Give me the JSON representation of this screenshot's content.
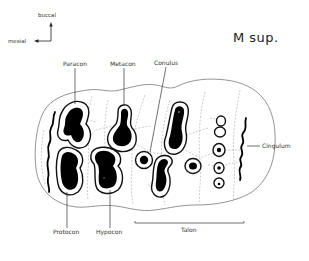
{
  "title": "M sup.",
  "orientation": {
    "up_label": "buccal",
    "left_label": "mesial"
  },
  "labels": {
    "paracon": "Paracon",
    "metacon": "Metacon",
    "conulus": "Conulus",
    "cingulum": "Cingulum",
    "protocon": "Protocon",
    "hypocon": "Hypocon",
    "talon": "Talon"
  },
  "colors": {
    "ink": "#000000",
    "outline": "#666666",
    "dashed": "#999999",
    "text": "#333333"
  }
}
